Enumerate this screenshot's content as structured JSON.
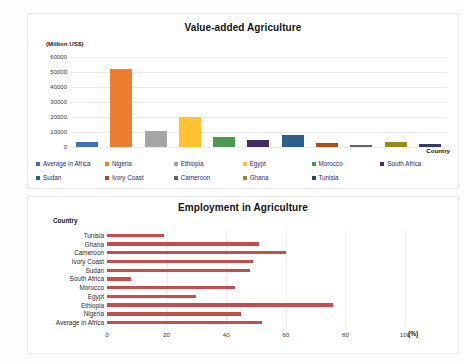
{
  "chart_data": [
    {
      "type": "bar",
      "title": "Value-added Agriculture",
      "ylabel": "(Million US$)",
      "xlabel": "Country",
      "ylim": [
        0,
        60000
      ],
      "yticks": [
        "60000",
        "50000",
        "40000",
        "30000",
        "20000",
        "10000",
        "0"
      ],
      "grid": true,
      "legend_position": "bottom",
      "categories": [
        "Average in Africa",
        "Nigeria",
        "Ethiopia",
        "Egypt",
        "Morocco",
        "South Africa",
        "Sudan",
        "Ivory Coast",
        "Cameroon",
        "Ghana",
        "Tunisia"
      ],
      "values": [
        3400,
        52000,
        11000,
        20000,
        7000,
        4800,
        8300,
        2800,
        1400,
        3400,
        2100
      ],
      "colors": [
        "#4472a8",
        "#ed7d31",
        "#a5a5a5",
        "#ffc331",
        "#4e9a51",
        "#462b60",
        "#2d5f8b",
        "#ab4f17",
        "#636363",
        "#998a1d",
        "#323c6e"
      ]
    },
    {
      "type": "bar",
      "orientation": "horizontal",
      "title": "Employment in Agriculture",
      "ylabel": "Country",
      "xlabel": "(%)",
      "xlim": [
        0,
        100
      ],
      "xticks": [
        "0",
        "20",
        "40",
        "60",
        "80",
        "100"
      ],
      "grid": true,
      "bar_color": "#c0504d",
      "categories": [
        "Tunisia",
        "Ghana",
        "Cameroon",
        "Ivory Coast",
        "Sudan",
        "South Africa",
        "Morocco",
        "Egypt",
        "Ethiopia",
        "Nigeria",
        "Average in Africa"
      ],
      "values": [
        19,
        51,
        60,
        49,
        48,
        8,
        43,
        30,
        76,
        45,
        52
      ]
    }
  ]
}
